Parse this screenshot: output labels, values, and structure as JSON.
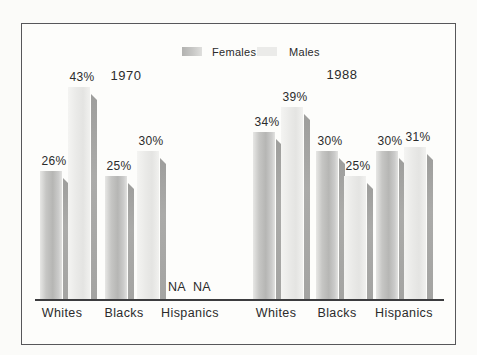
{
  "figure": {
    "background": "#fbfbf9",
    "frame_border_color": "#57575a",
    "text_color": "#2b2b2b"
  },
  "legend": {
    "items": [
      {
        "label": "Females",
        "swatch_color": "#c0c0be"
      },
      {
        "label": "Males",
        "swatch_color": "#ebebe9"
      }
    ]
  },
  "chart_data": {
    "type": "bar",
    "title": "",
    "value_suffix": "%",
    "ylim": [
      0,
      45
    ],
    "grid": false,
    "legend_position": "top-center",
    "missing_label": "NA",
    "panels": [
      {
        "year_label": "1970",
        "categories": [
          "Whites",
          "Blacks",
          "Hispanics"
        ],
        "series": [
          {
            "name": "Females",
            "values": [
              26,
              25,
              null
            ]
          },
          {
            "name": "Males",
            "values": [
              43,
              30,
              null
            ]
          }
        ]
      },
      {
        "year_label": "1988",
        "categories": [
          "Whites",
          "Blacks",
          "Hispanics"
        ],
        "series": [
          {
            "name": "Females",
            "values": [
              34,
              30,
              30
            ]
          },
          {
            "name": "Males",
            "values": [
              39,
              25,
              31
            ]
          }
        ]
      }
    ],
    "colors": {
      "females_bar": "#bcbcba",
      "males_bar": "#ebebe9",
      "bar_side_shadow": "#a4a4a2"
    }
  }
}
